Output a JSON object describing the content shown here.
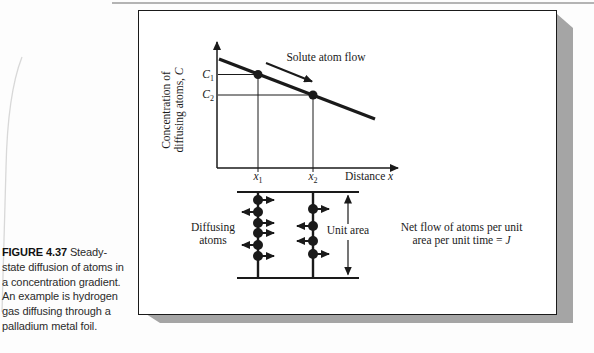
{
  "colors": {
    "ink": "#1a1a1a",
    "panel_background": "#ffffff",
    "panel_shadow": "#a5a5a5",
    "page_edge_line": "#9b9b9b",
    "page_curl": "#d8d8d8"
  },
  "caption": {
    "label": "FIGURE 4.37",
    "line1_rest": " Steady-",
    "line2": "state diffusion of atoms in",
    "line3": "a concentration gradient.",
    "line4": "An example is hydrogen",
    "line5": "gas diffusing through a",
    "line6": "palladium metal foil."
  },
  "graph": {
    "y_label_line1": "Concentration of",
    "y_label_line2": "diffusing atoms, ",
    "y_label_var": "C",
    "x_label": "Distance ",
    "x_label_var": "x",
    "c1_base": "C",
    "c1_sub": "1",
    "c2_base": "C",
    "c2_sub": "2",
    "x1_base": "x",
    "x1_sub": "1",
    "x2_base": "x",
    "x2_sub": "2",
    "flow_label": "Solute atom flow"
  },
  "diagram": {
    "left_label_line1": "Diffusing",
    "left_label_line2": "atoms",
    "unit_area": "Unit area",
    "net_flow_line1": "Net flow of atoms per unit",
    "net_flow_line2": "area per unit time = ",
    "net_flow_var": "J",
    "planes": [
      {
        "x": 258,
        "atoms": [
          {
            "y": 200,
            "dir": "right"
          },
          {
            "y": 212,
            "dir": "left"
          },
          {
            "y": 223,
            "dir": "right"
          },
          {
            "y": 233,
            "dir": "right"
          },
          {
            "y": 245,
            "dir": "left"
          },
          {
            "y": 256,
            "dir": "right"
          }
        ]
      },
      {
        "x": 313,
        "atoms": [
          {
            "y": 209,
            "dir": "right"
          },
          {
            "y": 226,
            "dir": "left"
          },
          {
            "y": 241,
            "dir": "left"
          },
          {
            "y": 254,
            "dir": "right"
          }
        ]
      }
    ]
  }
}
